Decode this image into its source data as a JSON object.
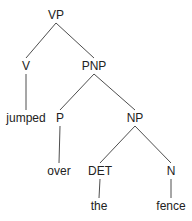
{
  "diagram": {
    "type": "syntax-tree",
    "nodes": [
      {
        "id": "vp",
        "label": "VP"
      },
      {
        "id": "v",
        "label": "V"
      },
      {
        "id": "pnp",
        "label": "PNP"
      },
      {
        "id": "jumped",
        "label": "jumped"
      },
      {
        "id": "p",
        "label": "P"
      },
      {
        "id": "np",
        "label": "NP"
      },
      {
        "id": "over",
        "label": "over"
      },
      {
        "id": "det",
        "label": "DET"
      },
      {
        "id": "n",
        "label": "N"
      },
      {
        "id": "the",
        "label": "the"
      },
      {
        "id": "fence",
        "label": "fence"
      }
    ],
    "edges": [
      {
        "from": "vp",
        "to": "v"
      },
      {
        "from": "vp",
        "to": "pnp"
      },
      {
        "from": "v",
        "to": "jumped"
      },
      {
        "from": "pnp",
        "to": "p"
      },
      {
        "from": "pnp",
        "to": "np"
      },
      {
        "from": "p",
        "to": "over"
      },
      {
        "from": "np",
        "to": "det"
      },
      {
        "from": "np",
        "to": "n"
      },
      {
        "from": "det",
        "to": "the"
      },
      {
        "from": "n",
        "to": "fence"
      }
    ],
    "colors": {
      "text": "#222222",
      "edge": "#3a3a3a",
      "background": "#ffffff"
    }
  }
}
